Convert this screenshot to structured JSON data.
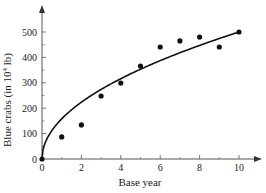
{
  "chart_data": {
    "type": "scatter",
    "title": "",
    "xlabel": "Base year",
    "ylabel": "Blue crabs (in 10⁴ lb)",
    "ylabel_parts": {
      "pre": "Blue crabs (in 10",
      "sup": "4",
      "post": " lb)"
    },
    "xlim": [
      0,
      10.8
    ],
    "ylim": [
      0,
      560
    ],
    "x_ticks": [
      0,
      2,
      4,
      6,
      8,
      10
    ],
    "x_minor_ticks": [
      1,
      3,
      5,
      7,
      9
    ],
    "y_ticks": [
      0,
      100,
      200,
      300,
      400,
      500
    ],
    "y_minor_ticks": [
      50,
      150,
      250,
      350,
      450
    ],
    "grid": false,
    "series": [
      {
        "name": "Observed data",
        "kind": "scatter",
        "x": [
          0,
          1,
          2,
          3,
          4,
          5,
          6,
          7,
          8,
          9,
          10
        ],
        "y": [
          0,
          87,
          134,
          248,
          299,
          366,
          441,
          465,
          480,
          441,
          500
        ]
      },
      {
        "name": "Fitted curve",
        "kind": "line",
        "model": "y = 158.1 * x^0.5",
        "coef": 158.1,
        "power": 0.5
      }
    ]
  },
  "axes": {
    "origin_label_x": "0",
    "origin_label_y": "0"
  }
}
